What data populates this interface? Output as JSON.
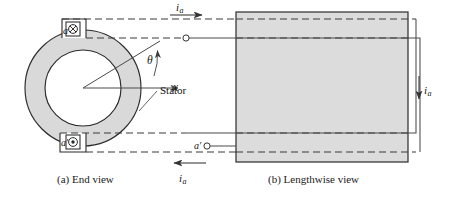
{
  "figure": {
    "background": "#ffffff",
    "stator_fill": "#d9d9d9",
    "stator_stroke": "#2b2b2b",
    "core_fill": "#d8d8d8",
    "dash_color": "#3a3a3a",
    "line_color": "#4a4a4a"
  },
  "panel_a": {
    "caption": "(a) End view",
    "stator_label": "Stator",
    "axis_label": "x",
    "angle_label": "θ",
    "coil_top": {
      "label": "a",
      "current_symbol": "⊗",
      "current_direction": "into-page"
    },
    "coil_bottom": {
      "label": "a′",
      "current_symbol": "⊙",
      "current_direction": "out-of-page"
    },
    "geometry": {
      "center_x": 83,
      "center_y": 88,
      "outer_radius": 58,
      "inner_radius": 38,
      "theta_degrees": 12
    }
  },
  "panel_b": {
    "caption": "(b) Lengthwise view",
    "terminal_label": "a′",
    "core": {
      "left": 236,
      "top": 12,
      "right": 408,
      "bottom": 162
    }
  },
  "currents": {
    "top": {
      "symbol": "i",
      "subscript": "a",
      "arrow": "right"
    },
    "bottom": {
      "symbol": "i",
      "subscript": "a",
      "arrow": "left"
    },
    "right": {
      "symbol": "i",
      "subscript": "a",
      "arrow": "down"
    }
  }
}
